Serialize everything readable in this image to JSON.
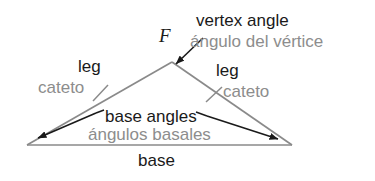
{
  "figure": {
    "background_color": "#ffffff",
    "english_text_color": "#1a1a1a",
    "spanish_text_color": "#8d8d8d",
    "triangle_line_color": "#8a8a8a",
    "arrow_color": "#1a1a1a"
  },
  "labels": {
    "vertex_angle_en": "vertex angle",
    "vertex_angle_es": "ángulo del vértice",
    "vertex_letter": "F",
    "leg_left_en": "leg",
    "leg_left_es": "cateto",
    "leg_right_en": "leg",
    "leg_right_es": "cateto",
    "base_angles_en": "base angles",
    "base_angles_es": "ángulos basales",
    "base_en": "base"
  },
  "geometry": {
    "apex": [
      172,
      62
    ],
    "base_left": [
      27,
      145
    ],
    "base_right": [
      292,
      145
    ],
    "tick_left": [
      100,
      93
    ],
    "tick_right": [
      214,
      95
    ]
  }
}
